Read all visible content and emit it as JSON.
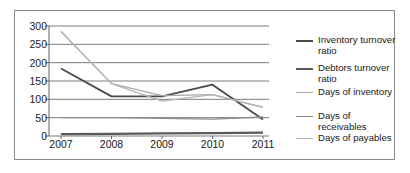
{
  "chart_data": {
    "type": "line",
    "title": "",
    "xlabel": "",
    "ylabel": "",
    "categories": [
      "2007",
      "2008",
      "2009",
      "2010",
      "2011"
    ],
    "ylim": [
      0,
      300
    ],
    "yticks": [
      0,
      50,
      100,
      150,
      200,
      250,
      300
    ],
    "ytick_labels": [
      "0",
      "50",
      "100",
      "150",
      "200",
      "250",
      "300"
    ],
    "grid": true,
    "legend_position": "right",
    "series": [
      {
        "name": "Inventory turnover ratio",
        "color": "#4a4a4a",
        "width": 1.8,
        "values": [
          184,
          108,
          108,
          140,
          45
        ]
      },
      {
        "name": "Debtors turnover ratio",
        "color": "#5a5a5a",
        "width": 2.2,
        "values": [
          5,
          6,
          7,
          8,
          9
        ]
      },
      {
        "name": "Days of inventory",
        "color": "#a8a8a8",
        "width": 1.2,
        "values": [
          285,
          143,
          110,
          113,
          78
        ]
      },
      {
        "name": "Days of receivables",
        "color": "#8c8c8c",
        "width": 1.4,
        "values": [
          50,
          50,
          48,
          46,
          52
        ]
      },
      {
        "name": "Days of payables",
        "color": "#b4b4b4",
        "width": 1.2,
        "values": [
          285,
          143,
          95,
          113,
          78
        ]
      }
    ]
  },
  "style": {
    "axis_color": "#5f5f5f",
    "grid_color": "#6e6e6e",
    "border_color": "#8a8a8a",
    "background": "#ffffff",
    "text_color": "#1a1a1a"
  }
}
